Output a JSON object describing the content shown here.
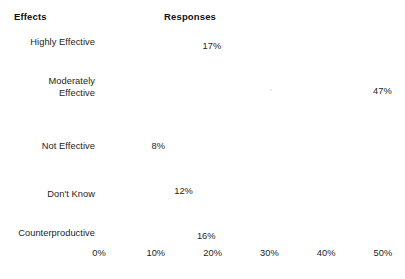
{
  "header": {
    "left_label": "Effects",
    "right_label": "Responses"
  },
  "chart_data": {
    "type": "bar",
    "orientation": "horizontal",
    "title": "",
    "subtitle": "",
    "xlabel": "Responses",
    "ylabel": "Effects",
    "categories": [
      "Highly Effective",
      "Moderately\nEffective",
      "Not Effective",
      "Don't Know",
      "Counterproductive"
    ],
    "values": [
      17,
      47,
      8,
      12,
      16
    ],
    "value_labels": [
      "17%",
      "47%",
      "8%",
      "12%",
      "16%"
    ],
    "xlim": [
      0,
      50
    ],
    "xticks": [
      0,
      10,
      20,
      30,
      40,
      50
    ],
    "xtick_labels": [
      "0%",
      "10%",
      "20%",
      "30%",
      "40%",
      "50%"
    ],
    "grid": false,
    "legend": "none",
    "bar_color": "#141414",
    "background_color": "#ffffff"
  },
  "axis": {
    "ticks": [
      {
        "label": "0%",
        "value": 0
      },
      {
        "label": "10%",
        "value": 10
      },
      {
        "label": "20%",
        "value": 20
      },
      {
        "label": "30%",
        "value": 30
      },
      {
        "label": "40%",
        "value": 40
      },
      {
        "label": "50%",
        "value": 50
      }
    ]
  },
  "bars": [
    {
      "label": "Highly Effective",
      "value": 17,
      "value_label": "17%"
    },
    {
      "label": "Moderately\nEffective",
      "value": 47,
      "value_label": "47%"
    },
    {
      "label": "Not Effective",
      "value": 8,
      "value_label": "8%"
    },
    {
      "label": "Don't Know",
      "value": 12,
      "value_label": "12%"
    },
    {
      "label": "Counterproductive",
      "value": 16,
      "value_label": "16%"
    }
  ]
}
